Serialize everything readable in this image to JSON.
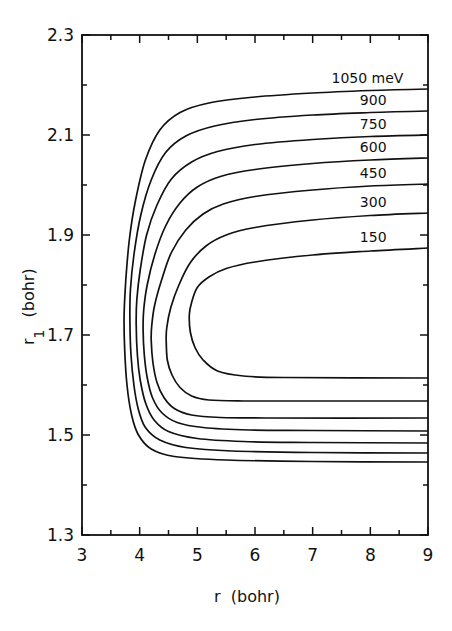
{
  "chart_data": {
    "type": "line",
    "subtype": "contour",
    "title": "",
    "xlabel": "r  (bohr)",
    "ylabel": "r",
    "ylabel_subscript": "1",
    "ylabel_unit": "(bohr)",
    "xlim": [
      3,
      9
    ],
    "ylim": [
      1.3,
      2.3
    ],
    "x_ticks": [
      3,
      4,
      5,
      6,
      7,
      8,
      9
    ],
    "x_tick_labels": [
      "3",
      "4",
      "5",
      "6",
      "7",
      "8",
      "9"
    ],
    "x_minor_ticks": [
      3.5,
      4.5,
      5.5,
      6.5,
      7.5,
      8.5
    ],
    "y_ticks": [
      1.3,
      1.5,
      1.7,
      1.9,
      2.1,
      2.3
    ],
    "y_tick_labels": [
      "1.3",
      "1.5",
      "1.7",
      "1.9",
      "2.1",
      "2.3"
    ],
    "y_minor_ticks": [
      1.4,
      1.6,
      1.8,
      2.0,
      2.2
    ],
    "grid": false,
    "legend": null,
    "contour_unit": "meV",
    "series": [
      {
        "name": "1050 meV",
        "level": 1050,
        "label": "1050 meV",
        "label_pos": [
          7.95,
          2.214
        ],
        "points": [
          [
            9.0,
            2.192
          ],
          [
            8.0,
            2.189
          ],
          [
            7.0,
            2.184
          ],
          [
            6.0,
            2.176
          ],
          [
            5.2,
            2.164
          ],
          [
            4.7,
            2.145
          ],
          [
            4.35,
            2.11
          ],
          [
            4.1,
            2.05
          ],
          [
            3.93,
            1.97
          ],
          [
            3.82,
            1.89
          ],
          [
            3.76,
            1.81
          ],
          [
            3.73,
            1.74
          ],
          [
            3.74,
            1.67
          ],
          [
            3.78,
            1.6
          ],
          [
            3.86,
            1.54
          ],
          [
            3.98,
            1.5
          ],
          [
            4.2,
            1.472
          ],
          [
            4.6,
            1.457
          ],
          [
            5.5,
            1.45
          ],
          [
            7.0,
            1.447
          ],
          [
            9.0,
            1.446
          ]
        ]
      },
      {
        "name": "900 meV",
        "level": 900,
        "label": "900",
        "label_pos": [
          8.05,
          2.17
        ],
        "points": [
          [
            9.0,
            2.148
          ],
          [
            8.0,
            2.145
          ],
          [
            7.0,
            2.14
          ],
          [
            6.0,
            2.131
          ],
          [
            5.3,
            2.118
          ],
          [
            4.8,
            2.098
          ],
          [
            4.45,
            2.065
          ],
          [
            4.2,
            2.01
          ],
          [
            4.02,
            1.94
          ],
          [
            3.9,
            1.86
          ],
          [
            3.84,
            1.79
          ],
          [
            3.83,
            1.73
          ],
          [
            3.85,
            1.66
          ],
          [
            3.9,
            1.6
          ],
          [
            3.98,
            1.55
          ],
          [
            4.1,
            1.515
          ],
          [
            4.35,
            1.49
          ],
          [
            4.8,
            1.475
          ],
          [
            5.6,
            1.468
          ],
          [
            7.0,
            1.465
          ],
          [
            9.0,
            1.464
          ]
        ]
      },
      {
        "name": "750 meV",
        "level": 750,
        "label": "750",
        "label_pos": [
          8.05,
          2.122
        ],
        "points": [
          [
            9.0,
            2.1
          ],
          [
            8.0,
            2.097
          ],
          [
            7.0,
            2.091
          ],
          [
            6.0,
            2.081
          ],
          [
            5.35,
            2.067
          ],
          [
            4.9,
            2.046
          ],
          [
            4.55,
            2.012
          ],
          [
            4.3,
            1.96
          ],
          [
            4.12,
            1.9
          ],
          [
            4.01,
            1.83
          ],
          [
            3.95,
            1.77
          ],
          [
            3.94,
            1.72
          ],
          [
            3.96,
            1.66
          ],
          [
            4.01,
            1.61
          ],
          [
            4.1,
            1.565
          ],
          [
            4.25,
            1.53
          ],
          [
            4.5,
            1.507
          ],
          [
            5.0,
            1.493
          ],
          [
            5.8,
            1.487
          ],
          [
            7.0,
            1.485
          ],
          [
            9.0,
            1.484
          ]
        ]
      },
      {
        "name": "600 meV",
        "level": 600,
        "label": "600",
        "label_pos": [
          8.05,
          2.076
        ],
        "points": [
          [
            9.0,
            2.054
          ],
          [
            8.0,
            2.05
          ],
          [
            7.0,
            2.043
          ],
          [
            6.0,
            2.031
          ],
          [
            5.4,
            2.017
          ],
          [
            5.0,
            1.996
          ],
          [
            4.7,
            1.964
          ],
          [
            4.45,
            1.918
          ],
          [
            4.26,
            1.86
          ],
          [
            4.13,
            1.8
          ],
          [
            4.07,
            1.75
          ],
          [
            4.06,
            1.71
          ],
          [
            4.08,
            1.66
          ],
          [
            4.13,
            1.615
          ],
          [
            4.22,
            1.575
          ],
          [
            4.38,
            1.545
          ],
          [
            4.65,
            1.525
          ],
          [
            5.1,
            1.515
          ],
          [
            5.9,
            1.51
          ],
          [
            7.0,
            1.509
          ],
          [
            9.0,
            1.508
          ]
        ]
      },
      {
        "name": "450 meV",
        "level": 450,
        "label": "450",
        "label_pos": [
          8.05,
          2.024
        ],
        "points": [
          [
            9.0,
            2.002
          ],
          [
            8.0,
            1.998
          ],
          [
            7.0,
            1.99
          ],
          [
            6.0,
            1.977
          ],
          [
            5.45,
            1.962
          ],
          [
            5.1,
            1.942
          ],
          [
            4.8,
            1.91
          ],
          [
            4.55,
            1.865
          ],
          [
            4.38,
            1.81
          ],
          [
            4.26,
            1.76
          ],
          [
            4.21,
            1.72
          ],
          [
            4.2,
            1.69
          ],
          [
            4.23,
            1.645
          ],
          [
            4.3,
            1.605
          ],
          [
            4.42,
            1.575
          ],
          [
            4.6,
            1.553
          ],
          [
            4.9,
            1.54
          ],
          [
            5.4,
            1.535
          ],
          [
            6.2,
            1.534
          ],
          [
            9.0,
            1.534
          ]
        ]
      },
      {
        "name": "300 meV",
        "level": 300,
        "label": "300",
        "label_pos": [
          8.05,
          1.966
        ],
        "points": [
          [
            9.0,
            1.944
          ],
          [
            8.0,
            1.939
          ],
          [
            7.0,
            1.93
          ],
          [
            6.0,
            1.915
          ],
          [
            5.5,
            1.9
          ],
          [
            5.15,
            1.878
          ],
          [
            4.88,
            1.845
          ],
          [
            4.68,
            1.8
          ],
          [
            4.54,
            1.755
          ],
          [
            4.47,
            1.715
          ],
          [
            4.46,
            1.69
          ],
          [
            4.48,
            1.65
          ],
          [
            4.56,
            1.62
          ],
          [
            4.7,
            1.595
          ],
          [
            4.9,
            1.578
          ],
          [
            5.2,
            1.57
          ],
          [
            5.8,
            1.568
          ],
          [
            7.0,
            1.568
          ],
          [
            9.0,
            1.568
          ]
        ]
      },
      {
        "name": "150 meV",
        "level": 150,
        "label": "150",
        "label_pos": [
          8.05,
          1.896
        ],
        "points": [
          [
            9.0,
            1.874
          ],
          [
            8.0,
            1.868
          ],
          [
            7.0,
            1.86
          ],
          [
            6.0,
            1.846
          ],
          [
            5.5,
            1.833
          ],
          [
            5.2,
            1.816
          ],
          [
            5.0,
            1.795
          ],
          [
            4.9,
            1.765
          ],
          [
            4.86,
            1.74
          ],
          [
            4.88,
            1.705
          ],
          [
            4.96,
            1.675
          ],
          [
            5.1,
            1.65
          ],
          [
            5.35,
            1.628
          ],
          [
            5.8,
            1.618
          ],
          [
            6.5,
            1.615
          ],
          [
            9.0,
            1.614
          ]
        ]
      }
    ]
  },
  "layout": {
    "plot_px": {
      "left": 82,
      "right": 428,
      "top": 35,
      "bottom": 535
    }
  }
}
